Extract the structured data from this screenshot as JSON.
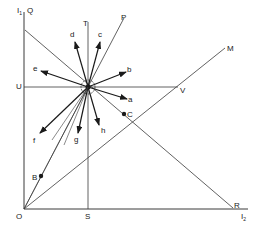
{
  "diagram": {
    "type": "indifference/vector geometric diagram",
    "colors": {
      "line": "#3a3a3a",
      "arrow": "#1a1a1a",
      "background": "#ffffff"
    },
    "axes": {
      "vertical_label": "I",
      "vertical_sub": "1",
      "horizontal_label": "I",
      "horizontal_sub": "2",
      "origin_label": "O"
    },
    "points": {
      "Q": "Q",
      "P": "P",
      "T": "T",
      "M": "M",
      "U": "U",
      "V": "V",
      "S": "S",
      "R": "R",
      "B": "B",
      "C": "C"
    },
    "arrows": [
      "a",
      "b",
      "c",
      "d",
      "e",
      "f",
      "g",
      "h"
    ]
  }
}
